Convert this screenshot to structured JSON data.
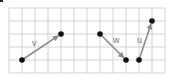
{
  "figure": {
    "grid": {
      "x0": 9,
      "y0": 8,
      "cell": 13,
      "cols": 12,
      "rows": 5,
      "line_color": "#c8c8c8"
    },
    "vectors": [
      {
        "name": "v",
        "label": "v",
        "start": [
          22,
          60
        ],
        "end": [
          61,
          34
        ],
        "label_pos": [
          32,
          46
        ]
      },
      {
        "name": "w",
        "label": "w",
        "start": [
          100,
          34
        ],
        "end": [
          126,
          60
        ],
        "label_pos": [
          113,
          43
        ]
      },
      {
        "name": "u",
        "label": "u",
        "start": [
          139,
          60
        ],
        "end": [
          152,
          21
        ],
        "label_pos": [
          137,
          43
        ]
      }
    ],
    "colors": {
      "vector": "#8a8a8a",
      "point": "#111111",
      "label": "#777777"
    }
  }
}
